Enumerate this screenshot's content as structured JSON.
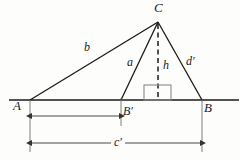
{
  "figure": {
    "kind": "geometry-triangle-diagram",
    "background_color": "#fdfdfc",
    "stroke_color": "#1a1a1a",
    "vertices": {
      "A": {
        "label": "A",
        "x": 30,
        "y": 100,
        "label_x": 13,
        "label_y": 99
      },
      "B": {
        "label": "B",
        "x": 202,
        "y": 100,
        "label_x": 203,
        "label_y": 101
      },
      "C": {
        "label": "C",
        "x": 158,
        "y": 22,
        "label_x": 154,
        "label_y": 1
      },
      "Bprime": {
        "label": "B′",
        "x": 121,
        "y": 100,
        "label_x": 123,
        "label_y": 105
      }
    },
    "sides": [
      {
        "name": "b",
        "label": "b",
        "label_x": 84,
        "label_y": 41,
        "from": "A",
        "to": "C"
      },
      {
        "name": "a",
        "label": "a",
        "label_x": 127,
        "label_y": 56,
        "from": "Bprime",
        "to": "C"
      },
      {
        "name": "h",
        "label": "h",
        "label_x": 163,
        "label_y": 59,
        "from": "C",
        "to": "foot",
        "style": "dashed"
      },
      {
        "name": "dprime",
        "label": "d′",
        "label_x": 186,
        "label_y": 55,
        "from": "B",
        "to": "C"
      }
    ],
    "right_angle_marker": {
      "name": "right-angle-marker",
      "x": 144,
      "y": 85,
      "width": 27,
      "height": 15
    },
    "baseline": {
      "x1": 9,
      "x2": 239,
      "y": 100
    },
    "dimensions": [
      {
        "name": "dimension-a-to-bprime",
        "label": "",
        "x1": 30,
        "x2": 120,
        "y": 116
      },
      {
        "name": "dimension-cprime",
        "label": "c′",
        "label_x": 111,
        "label_y": 137,
        "x1": 30,
        "x2": 202,
        "y": 143
      }
    ],
    "extension_lines": [
      {
        "name": "extension-line-A",
        "x": 30,
        "y1": 100,
        "y2": 152
      },
      {
        "name": "extension-line-Bprime",
        "x": 121,
        "y1": 98,
        "y2": 126
      },
      {
        "name": "extension-line-B",
        "x": 202,
        "y1": 100,
        "y2": 152
      }
    ]
  }
}
